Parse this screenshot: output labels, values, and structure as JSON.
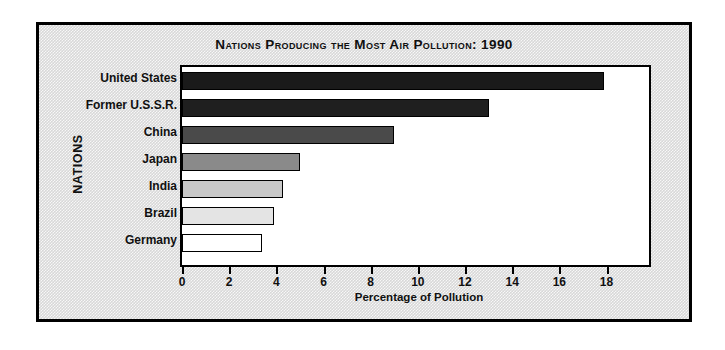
{
  "chart_data": {
    "type": "bar",
    "orientation": "horizontal",
    "title": "Nations Producing the Most Air Pollution: 1990",
    "xlabel": "Percentage of Pollution",
    "ylabel": "NATIONS",
    "categories": [
      "United States",
      "Former U.S.S.R.",
      "China",
      "Japan",
      "India",
      "Brazil",
      "Germany"
    ],
    "values": [
      17.9,
      13.0,
      9.0,
      5.0,
      4.3,
      3.9,
      3.4
    ],
    "xlim": [
      0,
      19.8
    ],
    "xticks": [
      0,
      2,
      4,
      6,
      8,
      10,
      12,
      14,
      16,
      18
    ],
    "xtick_labels": [
      "0",
      "2",
      "4",
      "6",
      "8",
      "10",
      "12",
      "14",
      "16",
      "18"
    ],
    "grid": false,
    "legend": "none",
    "bar_colors": [
      "#1a1a1a",
      "#1f1f1f",
      "#4a4a4a",
      "#8a8a8a",
      "#c8c8c8",
      "#e4e4e4",
      "#ffffff"
    ],
    "bar_border_color": "#000000",
    "plot_background": "#ffffff",
    "figure_background": "#d8d8d8",
    "frame_color": "#000000"
  }
}
